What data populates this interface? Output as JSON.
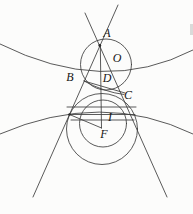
{
  "figure": {
    "ink_color": "#3c3c3c",
    "paper_color": "#fcfcfb",
    "canvas": {
      "width": 193,
      "height": 214
    },
    "labels": [
      {
        "name": "label-A",
        "text": "A",
        "x": 107,
        "y": 37
      },
      {
        "name": "label-O",
        "text": "O",
        "x": 117,
        "y": 62
      },
      {
        "name": "label-B",
        "text": "B",
        "x": 70,
        "y": 81
      },
      {
        "name": "label-D",
        "text": "D",
        "x": 107,
        "y": 82
      },
      {
        "name": "label-C",
        "text": "C",
        "x": 128,
        "y": 99
      },
      {
        "name": "label-I",
        "text": "I",
        "x": 110,
        "y": 121
      },
      {
        "name": "label-F",
        "text": "F",
        "x": 104,
        "y": 138
      }
    ],
    "lines": [
      {
        "name": "line-left-tangent",
        "x1": 118,
        "y1": 5,
        "x2": 33,
        "y2": 197
      },
      {
        "name": "line-right-tangent",
        "x1": 85,
        "y1": 13,
        "x2": 167,
        "y2": 197
      },
      {
        "name": "segment-vertical-axis",
        "x1": 100.3,
        "y1": 45,
        "x2": 101.5,
        "y2": 128
      },
      {
        "name": "segment-chord-BC",
        "x1": 84,
        "y1": 81,
        "x2": 125,
        "y2": 93
      },
      {
        "name": "segment-chord-upper",
        "x1": 67,
        "y1": 107,
        "x2": 136,
        "y2": 107
      },
      {
        "name": "segment-chord-tangency",
        "x1": 69,
        "y1": 114.5,
        "x2": 135,
        "y2": 114.5
      },
      {
        "name": "segment-chord-lower",
        "x1": 71,
        "y1": 120,
        "x2": 134,
        "y2": 120
      },
      {
        "name": "segment-radius-TF",
        "x1": 69.5,
        "y1": 114.5,
        "x2": 101.5,
        "y2": 128
      }
    ],
    "circles": [
      {
        "name": "circle-upper-O",
        "cx": 106,
        "cy": 64.5,
        "r": 25.5
      },
      {
        "name": "circle-middle",
        "cx": 103,
        "cy": 123.5,
        "r": 23.5
      },
      {
        "name": "circle-lower-F",
        "cx": 102,
        "cy": 129,
        "r": 35.5
      }
    ],
    "curves": [
      {
        "name": "curve-upper-conic-branch",
        "d": "M 0 44 Q 104 96 193 50"
      },
      {
        "name": "curve-lower-conic-branch",
        "d": "M 0 134 Q 102 90 193 134"
      },
      {
        "name": "curve-arc-BC",
        "d": "M 84 81 Q 104 92 124 94.5"
      }
    ],
    "dots": [
      {
        "name": "dot-vertex-A",
        "cx": 99.8,
        "cy": 45.5,
        "r": 1.4
      },
      {
        "name": "dot-tangency-left",
        "cx": 69.5,
        "cy": 114.5,
        "r": 1.2
      }
    ]
  }
}
